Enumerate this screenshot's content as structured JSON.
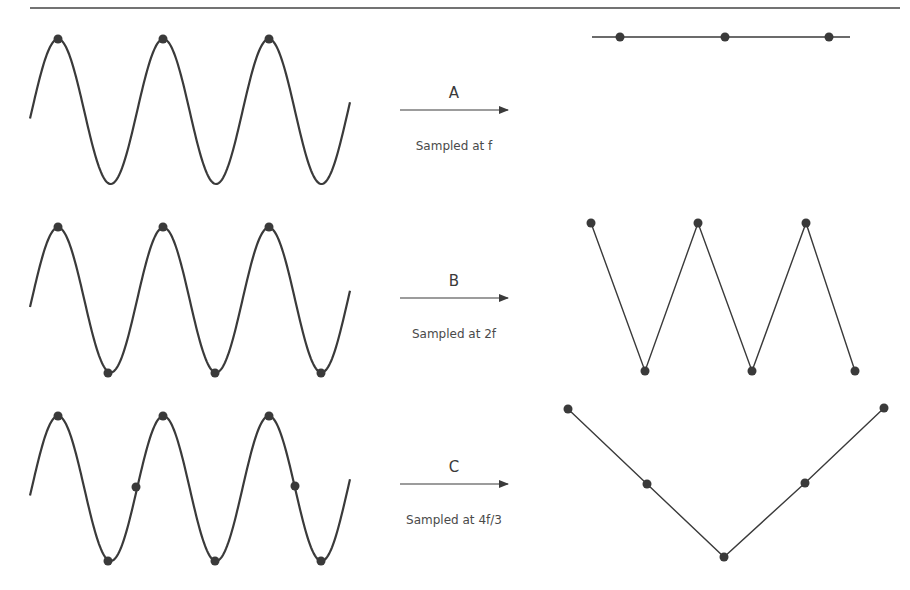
{
  "figure": {
    "colors": {
      "ink": "#3a3a3a",
      "rule": "#444444",
      "background": "#ffffff"
    },
    "top_rule": {
      "x1": 30,
      "x2": 900,
      "y": 8
    },
    "wave": {
      "x_start": 30,
      "x_end": 350,
      "first_peak_x": 58,
      "half_period": 52.7,
      "amplitude": 72.5
    },
    "rows": [
      {
        "id": "A",
        "letter": "A",
        "caption": "Sampled at f",
        "center_y": 111.5,
        "arrow": {
          "x1": 400,
          "x2": 508,
          "y": 110
        },
        "samples": [
          [
            58,
            39
          ],
          [
            163,
            39
          ],
          [
            269,
            39
          ]
        ],
        "output": {
          "line": [
            [
              592,
              37
            ],
            [
              850,
              37
            ]
          ],
          "points": [
            [
              620,
              37
            ],
            [
              725,
              37
            ],
            [
              829,
              37
            ]
          ]
        }
      },
      {
        "id": "B",
        "letter": "B",
        "caption": "Sampled at 2f",
        "center_y": 300,
        "arrow": {
          "x1": 400,
          "x2": 508,
          "y": 298
        },
        "samples": [
          [
            58,
            227
          ],
          [
            108,
            373
          ],
          [
            163,
            227
          ],
          [
            215,
            373
          ],
          [
            269,
            227
          ],
          [
            321,
            373
          ]
        ],
        "output": {
          "line": [
            [
              591,
              223
            ],
            [
              645,
              371
            ],
            [
              698,
              223
            ],
            [
              752,
              371
            ],
            [
              806,
              223
            ],
            [
              855,
              371
            ]
          ],
          "points": [
            [
              591,
              223
            ],
            [
              645,
              371
            ],
            [
              698,
              223
            ],
            [
              752,
              371
            ],
            [
              806,
              223
            ],
            [
              855,
              371
            ]
          ]
        }
      },
      {
        "id": "C",
        "letter": "C",
        "caption": "Sampled at 4f/3",
        "center_y": 488.5,
        "arrow": {
          "x1": 400,
          "x2": 508,
          "y": 484
        },
        "samples": [
          [
            58,
            416
          ],
          [
            108,
            561
          ],
          [
            136,
            487
          ],
          [
            163,
            416
          ],
          [
            215,
            561
          ],
          [
            269,
            416
          ],
          [
            295,
            486
          ],
          [
            321,
            561
          ]
        ],
        "output": {
          "line": [
            [
              568,
              409
            ],
            [
              647,
              484
            ],
            [
              724,
              557
            ],
            [
              805,
              483
            ],
            [
              884,
              408
            ]
          ],
          "points": [
            [
              568,
              409
            ],
            [
              647,
              484
            ],
            [
              724,
              557
            ],
            [
              805,
              483
            ],
            [
              884,
              408
            ]
          ]
        }
      }
    ]
  }
}
